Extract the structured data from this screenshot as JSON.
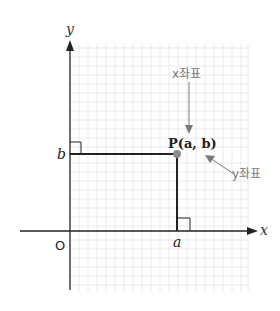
{
  "diagram": {
    "type": "coordinate-plane",
    "axes": {
      "x_label": "x",
      "y_label": "y",
      "origin_label": "O"
    },
    "point": {
      "label": "P(a, b)",
      "x_name": "a",
      "y_name": "b"
    },
    "annotations": {
      "x_coord_label": "x좌표",
      "y_coord_label": "y좌표"
    },
    "colors": {
      "axis": "#222222",
      "grid": "#e2e2e2",
      "point": "#8a8a8a",
      "arrow": "#7a7a7a",
      "guide_line": "#222222"
    }
  }
}
